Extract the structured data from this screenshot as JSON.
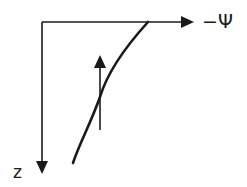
{
  "diagram": {
    "axes": {
      "x_axis_label": "−Ψ",
      "y_axis_label": "z"
    },
    "colors": {
      "stroke": "#1a1a1a",
      "background": "#ffffff"
    },
    "elements": [
      {
        "type": "axis",
        "direction": "right",
        "label": "−Ψ"
      },
      {
        "type": "axis",
        "direction": "down",
        "label": "z"
      },
      {
        "type": "curve",
        "description": "concave profile from top-right toward bottom-left"
      },
      {
        "type": "arrow",
        "direction": "up",
        "description": "upward flux arrow crossing the curve"
      }
    ]
  }
}
